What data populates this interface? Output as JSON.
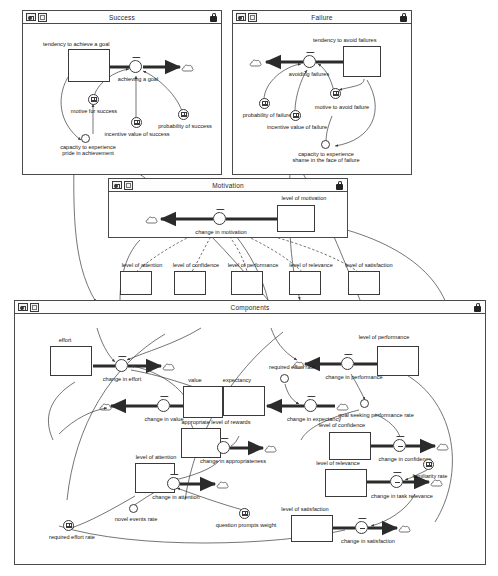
{
  "document": {
    "type": "system-dynamics-model",
    "app_style": "stock-and-flow modelling window set"
  },
  "panels": [
    {
      "id": "success",
      "title": "Success",
      "lock": "locked",
      "x": 22,
      "y": 10,
      "w": 200,
      "h": 165
    },
    {
      "id": "failure",
      "title": "Failure",
      "lock": "locked",
      "x": 232,
      "y": 10,
      "w": 180,
      "h": 165
    },
    {
      "id": "motivation",
      "title": "Motivation",
      "lock": "locked",
      "x": 108,
      "y": 178,
      "w": 240,
      "h": 60
    },
    {
      "id": "components",
      "title": "Components",
      "lock": "locked",
      "x": 14,
      "y": 300,
      "w": 472,
      "h": 265
    }
  ],
  "titlebar_icons": [
    {
      "name": "diagram-view-icon",
      "title": "diagram view"
    },
    {
      "name": "frame-view-icon",
      "title": "frame view"
    },
    {
      "name": "lock-icon",
      "title": "locked"
    }
  ],
  "success": {
    "stock": "tendency to achieve a goal",
    "flow": "achieving a goal",
    "converters": [
      "motive for success",
      "incentive value of success",
      "probability of success"
    ],
    "aux": "capacity to experience\npride in achievement",
    "aux_line1": "capacity to experience",
    "aux_line2": "pride in achievement"
  },
  "failure": {
    "stock": "tendency to avoid failures",
    "flow": "avoiding failures",
    "converters": [
      "probability of failure",
      "incentive value of failure",
      "motive to avoid failure"
    ],
    "aux_line1": "capacity to experience",
    "aux_line2": "shame in the face of failure"
  },
  "motivation": {
    "stock": "level of motivation",
    "flow": "change in motivation",
    "ghost_stocks": [
      "level of attention",
      "level of confidence",
      "level of performance",
      "level of relevance",
      "level of satisfaction"
    ]
  },
  "components": {
    "stocks": [
      "effort",
      "value",
      "expectancy",
      "appropriate level of rewards",
      "level of attention",
      "level of performance",
      "level of confidence",
      "level of relevance",
      "level of satisfaction"
    ],
    "flows": [
      "change in effort",
      "change in value",
      "change in expectancy",
      "change in appropriateness",
      "change in attention",
      "change in performance",
      "change in confidence",
      "change in task relevance",
      "change in satisfaction"
    ],
    "auxiliaries": [
      "required effort rate",
      "novel events rate",
      "goal seeking performance rate"
    ],
    "converters": [
      "required effort rate",
      "question prompts weight",
      "familiarity rate"
    ]
  },
  "labels": {
    "tendency_to_achieve_a_goal": "tendency to achieve a goal",
    "achieving_a_goal": "achieving a goal",
    "motive_for_success": "motive for success",
    "incentive_value_of_success": "incentive value of success",
    "probability_of_success": "probability of success",
    "cap_pride_1": "capacity to experience",
    "cap_pride_2": "pride in achievement",
    "tendency_to_avoid_failures": "tendency to avoid failures",
    "avoiding_failures": "avoiding failures",
    "motive_to_avoid_failure": "motive to avoid failure",
    "incentive_value_of_failure": "incentive value of failure",
    "probability_of_failure": "probability of failure",
    "cap_shame_1": "capacity to experience",
    "cap_shame_2": "shame in the face of failure",
    "level_of_motivation": "level of motivation",
    "change_in_motivation": "change in motivation",
    "level_of_attention": "level of attention",
    "level_of_confidence": "level of confidence",
    "level_of_performance": "level of performance",
    "level_of_relevance": "level of relevance",
    "level_of_satisfaction": "level of satisfaction",
    "effort": "effort",
    "change_in_effort": "change in effort",
    "value": "value",
    "change_in_value": "change in value",
    "expectancy": "expectancy",
    "required_effort_rate_top": "required effort rate",
    "change_in_expectancy": "change in expectancy",
    "appropriate_level_of_rewards": "appropriate level of rewards",
    "change_in_appropriateness": "change in appropriateness",
    "change_in_performance": "change in performance",
    "goal_seeking_performance_rate": "goal seeking performance rate",
    "change_in_confidence": "change in confidence",
    "familiarity_rate": "familiarity rate",
    "change_in_task_relevance": "change in task relevance",
    "change_in_attention": "change in attention",
    "novel_events_rate": "novel events rate",
    "question_prompts_weight": "question prompts weight",
    "change_in_satisfaction": "change in satisfaction",
    "required_effort_rate_bottom": "required effort rate"
  },
  "colors": {
    "line": "#3a3a3a",
    "flow_pipe": "#2b2b2b",
    "panel_border": "#4a4a4a",
    "background": "#ffffff",
    "text": "#151515"
  }
}
